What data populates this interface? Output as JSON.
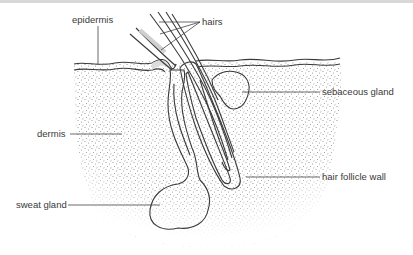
{
  "diagram": {
    "labels": {
      "epidermis": "epidermis",
      "hairs": "hairs",
      "sebaceous_gland": "sebaceous gland",
      "dermis": "dermis",
      "hair_follicle_wall": "hair follicle wall",
      "sweat_gland": "sweat gland"
    },
    "colors": {
      "stipple": "#9a9a9a",
      "gland_fill": "#d4d4d4",
      "outline": "#3a3a3a",
      "text": "#3a3a3a"
    }
  }
}
